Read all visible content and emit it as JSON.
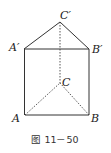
{
  "figure": {
    "caption": "图 11－50",
    "shape": "triangular prism",
    "vertices": {
      "A": {
        "label": "A",
        "x": 25,
        "y": 115
      },
      "B": {
        "label": "B",
        "x": 89,
        "y": 115
      },
      "C": {
        "label": "C",
        "x": 60,
        "y": 83
      },
      "A1": {
        "label": "A′",
        "x": 24,
        "y": 49
      },
      "B1": {
        "label": "B′",
        "x": 89,
        "y": 49
      },
      "C1": {
        "label": "C′",
        "x": 60,
        "y": 22
      }
    },
    "edges_solid": [
      "A-B",
      "A-A′",
      "B-B′",
      "A′-B′",
      "A′-C′",
      "B′-C′"
    ],
    "edges_hidden": [
      "C-C′",
      "A-C",
      "B-C"
    ],
    "colors": {
      "line": "#333333",
      "text": "#222222"
    }
  }
}
